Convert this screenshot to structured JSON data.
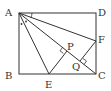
{
  "diagram": {
    "type": "geometry",
    "stroke_color": "#333333",
    "points": {
      "A": {
        "label": "A",
        "x": 19,
        "y": 13
      },
      "B": {
        "label": "B",
        "x": 19,
        "y": 74
      },
      "C": {
        "label": "C",
        "x": 96,
        "y": 74
      },
      "D": {
        "label": "D",
        "x": 96,
        "y": 13
      },
      "E": {
        "label": "E",
        "x": 49,
        "y": 74
      },
      "F": {
        "label": "F",
        "x": 96,
        "y": 41
      },
      "P": {
        "label": "P",
        "x": 67,
        "y": 51
      },
      "Q": {
        "label": "Q",
        "x": 80,
        "y": 61
      }
    },
    "segments": [
      "AB",
      "BC",
      "CD",
      "DA",
      "AC",
      "AE",
      "AF",
      "EP",
      "FQ"
    ],
    "right_angles": [
      "P",
      "Q"
    ],
    "angle_marks": [
      "BAE",
      "EAC",
      "DAF"
    ]
  }
}
